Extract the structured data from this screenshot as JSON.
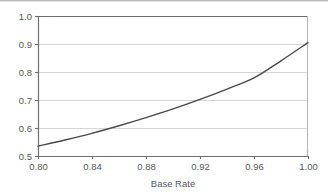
{
  "chart_data": {
    "type": "line",
    "title": "",
    "subtitle": "",
    "xlabel": "Base Rate",
    "ylabel": "",
    "xlim": [
      0.8,
      1.0
    ],
    "ylim": [
      0.5,
      1.0
    ],
    "xticks": [
      0.8,
      0.84,
      0.88,
      0.92,
      0.96,
      1.0
    ],
    "xtick_labels": [
      "0.80",
      "0.84",
      "0.88",
      "0.92",
      "0.96",
      "1.00"
    ],
    "yticks": [
      0.5,
      0.6,
      0.7,
      0.8,
      0.9,
      1.0
    ],
    "ytick_labels": [
      "0.5",
      "0.6",
      "0.7",
      "0.8",
      "0.9",
      "1.0"
    ],
    "grid": {
      "horizontal": true,
      "vertical": false
    },
    "legend": {
      "visible": false,
      "position": "none"
    },
    "series": [
      {
        "name": "accuracy",
        "color": "#4a4a4c",
        "line_width": 1.4,
        "x": [
          0.8,
          0.82,
          0.84,
          0.86,
          0.88,
          0.9,
          0.92,
          0.94,
          0.96,
          0.98,
          1.0
        ],
        "y": [
          0.535,
          0.557,
          0.581,
          0.608,
          0.637,
          0.668,
          0.702,
          0.739,
          0.779,
          0.84,
          0.905
        ]
      }
    ],
    "annotations": []
  },
  "figure": {
    "background_color": "#ffffff",
    "axis_color": "#6f6f71",
    "grid_color": "#d6d6d6",
    "text_color": "#58585a",
    "scan_line_color": "#b9b9b9"
  }
}
